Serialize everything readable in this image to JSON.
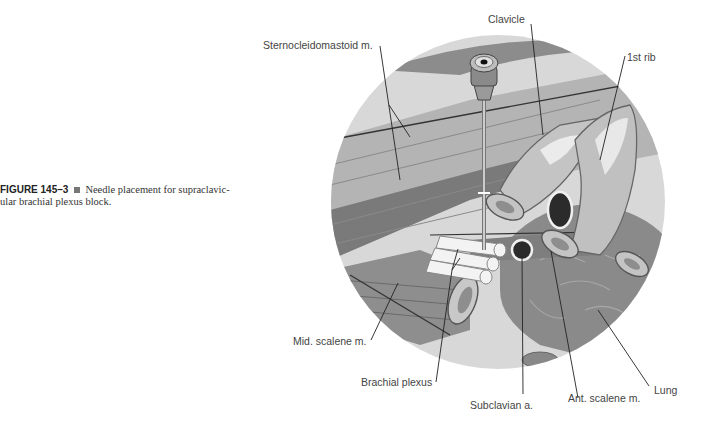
{
  "caption": {
    "figure_number": "FIGURE 145–3",
    "text_line1": "Needle placement for supraclavic-",
    "text_line2": "ular brachial plexus block."
  },
  "labels": {
    "sternocleidomastoid": "Sternocleidomastoid m.",
    "clavicle": "Clavicle",
    "first_rib": "1st rib",
    "mid_scalene": "Mid. scalene m.",
    "brachial_plexus": "Brachial plexus",
    "subclavian": "Subclavian a.",
    "ant_scalene": "Ant. scalene m.",
    "lung": "Lung"
  },
  "colors": {
    "background": "#ffffff",
    "circle_bg": "#d6d6d6",
    "muscle": "#9a9a9a",
    "muscle_dark": "#6e6e6e",
    "bone": "#bdbdbd",
    "vessel": "#2b2b2b",
    "nerve": "#f2f2f2",
    "lung": "#8a8a8a",
    "leader_line": "#222222"
  }
}
